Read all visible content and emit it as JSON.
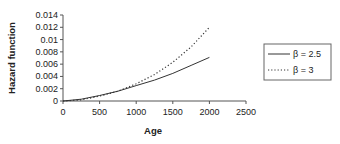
{
  "chart_data": {
    "type": "line",
    "title": "",
    "xlabel": "Age",
    "ylabel": "Hazard function",
    "xlim": [
      0,
      2500
    ],
    "ylim": [
      0,
      0.014
    ],
    "x_ticks": [
      "0",
      "500",
      "1000",
      "1500",
      "2000",
      "2500"
    ],
    "y_ticks": [
      "0",
      "0.002",
      "0.004",
      "0.006",
      "0.008",
      "0.01",
      "0.012",
      "0.014"
    ],
    "grid": false,
    "legend_position": "right",
    "x": [
      0,
      250,
      500,
      750,
      1000,
      1250,
      1500,
      1750,
      2000
    ],
    "series": [
      {
        "name": "β = 2.5",
        "style": "solid",
        "values": [
          0,
          0.0003,
          0.0009,
          0.0016,
          0.0025,
          0.0034,
          0.0045,
          0.0058,
          0.0071
        ]
      },
      {
        "name": "β = 3",
        "style": "dotted",
        "values": [
          0,
          0.0002,
          0.0008,
          0.0016,
          0.0028,
          0.0043,
          0.0063,
          0.0088,
          0.012
        ]
      }
    ]
  },
  "legend": {
    "items": [
      {
        "label": "β = 2.5",
        "style": "solid"
      },
      {
        "label": "β = 3",
        "style": "dotted"
      }
    ]
  }
}
